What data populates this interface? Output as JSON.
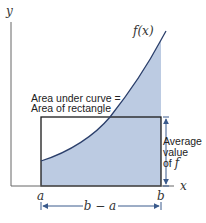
{
  "diagram": {
    "axes": {
      "x_label": "x",
      "y_label": "y"
    },
    "curve_label": "f(x)",
    "interval": {
      "left": "a",
      "right": "b",
      "width_label": "b − a"
    },
    "annotation": {
      "line1": "Area under curve =",
      "line2": "Area of rectangle"
    },
    "height_annotation": {
      "line1": "Average",
      "line2": "value",
      "line3_prefix": "of ",
      "line3_symbol": "f"
    },
    "colors": {
      "fill": "#bccbe2",
      "curve": "#2b3f6b",
      "rectangle": "#1a1a1a",
      "axis": "#555555",
      "arrow": "#3a5a8c"
    }
  }
}
